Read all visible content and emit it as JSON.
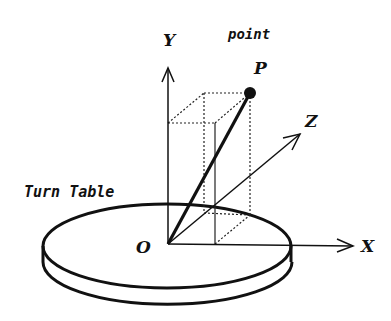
{
  "diagram": {
    "labels": {
      "y_axis": "Y",
      "x_axis": "X",
      "z_axis": "Z",
      "origin": "O",
      "point_caption": "point",
      "point_name": "P",
      "turn_table": "Turn Table"
    },
    "colors": {
      "ink": "#111111",
      "background": "#ffffff"
    },
    "elements": [
      {
        "type": "axis",
        "name": "Y",
        "from": "O",
        "direction": "up"
      },
      {
        "type": "axis",
        "name": "X",
        "from": "O",
        "direction": "right"
      },
      {
        "type": "axis",
        "name": "Z",
        "from": "O",
        "direction": "depth (up-right)"
      },
      {
        "type": "point",
        "name": "P"
      },
      {
        "type": "segment",
        "from": "O",
        "to": "P",
        "style": "bold"
      },
      {
        "type": "box",
        "description": "projection box from O to P",
        "style": "dotted/thin"
      },
      {
        "type": "disk",
        "name": "Turn Table",
        "centered_at": "O"
      }
    ]
  }
}
